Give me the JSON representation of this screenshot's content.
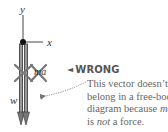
{
  "diagram": {
    "axes": {
      "y_label": "y",
      "x_label": "x"
    },
    "force_label_w": "w",
    "crossed_vector_label": "ma",
    "callout": {
      "marker": "◄",
      "title": "WRONG",
      "lines": [
        {
          "pre": "This vector doesn’t",
          "em": "",
          "post": ""
        },
        {
          "pre": "belong in a free-body",
          "em": "",
          "post": ""
        },
        {
          "pre": "diagram because ",
          "em": "ma",
          "post": ""
        },
        {
          "pre": "is ",
          "em": "not",
          "post": " a force."
        }
      ]
    },
    "colors": {
      "arrow_fill": "#9a9a9a",
      "arrow_edge": "#333333",
      "axis": "#444444",
      "text": "#666666",
      "title": "#555555"
    }
  }
}
